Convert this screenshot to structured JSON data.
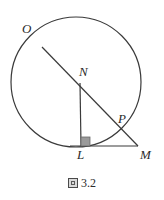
{
  "figure": {
    "caption_glyph": "tofu-box-glyph",
    "caption_number": "3.2",
    "background_color": "#ffffff",
    "stroke_color": "#3a3a3a",
    "right_angle_fill": "#9a9a9a",
    "label_color": "#2b2b2b"
  },
  "labels": {
    "O": "O",
    "N": "N",
    "P": "P",
    "L": "L",
    "M": "M"
  },
  "geometry": {
    "circle": {
      "cx": 76,
      "cy": 82,
      "r": 65
    },
    "points": {
      "O": {
        "x": 42,
        "y": 47
      },
      "N": {
        "x": 80,
        "y": 83
      },
      "P": {
        "x": 128,
        "y": 129
      },
      "L": {
        "x": 81,
        "y": 146
      },
      "M": {
        "x": 138,
        "y": 146
      }
    },
    "segments": [
      {
        "name": "O-to-M",
        "from": "O",
        "to": "M"
      },
      {
        "name": "N-to-L",
        "from": "N",
        "to": "L"
      },
      {
        "name": "L-to-M",
        "from": "L",
        "to": "M"
      }
    ],
    "right_angle_at": "L"
  }
}
